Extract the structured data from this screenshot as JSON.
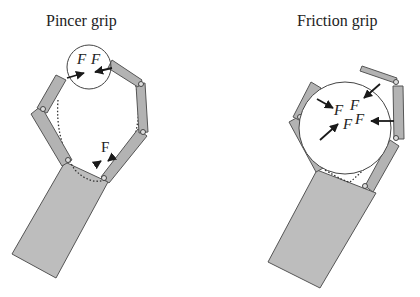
{
  "panels": [
    {
      "title": "Pincer grip",
      "force_labels": [
        "F",
        "F",
        "F"
      ],
      "description": "Two-finger gripper with fingertip contact on small circle; third force at base"
    },
    {
      "title": "Friction grip",
      "force_labels": [
        "F",
        "F",
        "F",
        "F"
      ],
      "description": "Gripper enveloping a large circular object with multiple contact forces"
    }
  ],
  "colors": {
    "link_fill": "#b3b3b3",
    "link_stroke": "#555555",
    "palm_fill": "#bdbdbd",
    "arrow": "#1a1a1a",
    "object_stroke": "#444444"
  }
}
